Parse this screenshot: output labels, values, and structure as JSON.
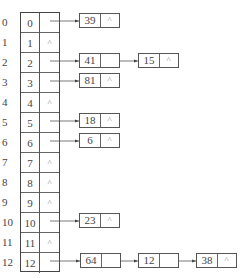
{
  "hash_table": {
    "rows": [
      {
        "index": "0",
        "key": "0",
        "ptr": "",
        "has_chain": true
      },
      {
        "index": "1",
        "key": "1",
        "ptr": "^",
        "has_chain": false
      },
      {
        "index": "2",
        "key": "2",
        "ptr": "",
        "has_chain": true
      },
      {
        "index": "3",
        "key": "3",
        "ptr": "",
        "has_chain": true
      },
      {
        "index": "4",
        "key": "4",
        "ptr": "^",
        "has_chain": false
      },
      {
        "index": "5",
        "key": "5",
        "ptr": "",
        "has_chain": true
      },
      {
        "index": "6",
        "key": "6",
        "ptr": "",
        "has_chain": true
      },
      {
        "index": "7",
        "key": "7",
        "ptr": "^",
        "has_chain": false
      },
      {
        "index": "8",
        "key": "8",
        "ptr": "^",
        "has_chain": false
      },
      {
        "index": "9",
        "key": "9",
        "ptr": "^",
        "has_chain": false
      },
      {
        "index": "10",
        "key": "10",
        "ptr": "",
        "has_chain": true
      },
      {
        "index": "11",
        "key": "11",
        "ptr": "^",
        "has_chain": false
      },
      {
        "index": "12",
        "key": "12",
        "ptr": "",
        "has_chain": true
      }
    ]
  },
  "chains": {
    "row0": [
      {
        "value": "39",
        "next": "^"
      }
    ],
    "row2": [
      {
        "value": "41",
        "next": ""
      },
      {
        "value": "15",
        "next": "^"
      }
    ],
    "row3": [
      {
        "value": "81",
        "next": "^"
      }
    ],
    "row5": [
      {
        "value": "18",
        "next": "^"
      }
    ],
    "row6": [
      {
        "value": "6",
        "next": "^"
      }
    ],
    "row10": [
      {
        "value": "23",
        "next": "^"
      }
    ],
    "row12": [
      {
        "value": "64",
        "next": ""
      },
      {
        "value": "12",
        "next": ""
      },
      {
        "value": "38",
        "next": "^"
      }
    ]
  },
  "null_symbol": "^"
}
